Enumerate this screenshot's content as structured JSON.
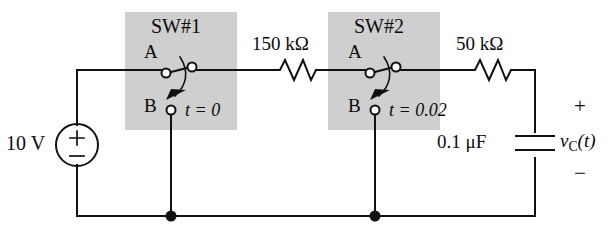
{
  "figure": {
    "kind": "circuit-schematic",
    "background_color": "#ffffff",
    "line_color": "#111111",
    "shaded_box_color": "#cfcfcf"
  },
  "source": {
    "name": "dc-voltage-source",
    "label": "10 V",
    "plus_sign": "+",
    "minus_sign": "−"
  },
  "switches": [
    {
      "name": "switch-1",
      "title": "SW#1",
      "terminal_a": "A",
      "terminal_b": "B",
      "time_label": "t = 0",
      "time_value": "0",
      "position": "A"
    },
    {
      "name": "switch-2",
      "title": "SW#2",
      "terminal_a": "A",
      "terminal_b": "B",
      "time_label": "t = 0.02",
      "time_value": "0.02",
      "position": "A"
    }
  ],
  "resistors": [
    {
      "name": "resistor-150k",
      "label": "150 kΩ",
      "value": "150",
      "unit": "kΩ"
    },
    {
      "name": "resistor-50k",
      "label": "50 kΩ",
      "value": "50",
      "unit": "kΩ"
    }
  ],
  "capacitor": {
    "name": "capacitor-c",
    "label": "0.1 μF",
    "value": "0.1",
    "unit": "μF",
    "voltage_label": "v",
    "voltage_subscript": "C",
    "voltage_arg": "(t)",
    "polarity_plus": "+",
    "polarity_minus": "−"
  },
  "nodes": [
    {
      "name": "node-bottom-left",
      "type": "junction-dot"
    },
    {
      "name": "node-bottom-right",
      "type": "junction-dot"
    }
  ]
}
